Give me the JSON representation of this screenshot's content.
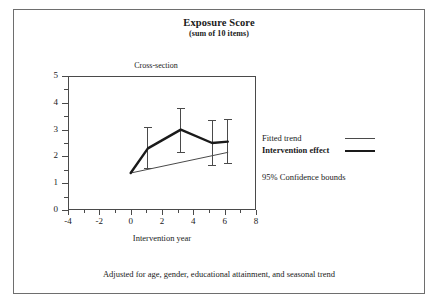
{
  "figure": {
    "title": "Exposure Score",
    "subtitle": "(sum of 10 items)",
    "panel_label": "Cross-section",
    "footnote": "Adjusted for age, gender, educational attainment, and seasonal trend"
  },
  "legend": {
    "fitted_trend": "Fitted trend",
    "intervention_effect": "Intervention effect",
    "confidence": "95% Confidence bounds"
  },
  "chart_data": {
    "type": "line",
    "title": "Exposure Score",
    "subtitle": "(sum of 10 items)",
    "panel_label": "Cross-section",
    "xlabel": "Intervention year",
    "ylabel": "",
    "xlim": [
      -4,
      8
    ],
    "ylim": [
      0,
      5
    ],
    "xticks": [
      -4,
      -2,
      0,
      2,
      4,
      6,
      8
    ],
    "xticklabels": [
      "-4",
      "-2",
      "0",
      "2",
      "4",
      "6",
      "8"
    ],
    "xminorticks": [
      -3,
      -1,
      1,
      3,
      5,
      7
    ],
    "yticks": [
      0,
      1,
      2,
      3,
      4,
      5
    ],
    "yticklabels": [
      "0",
      "1",
      "2",
      "3",
      "4",
      "5"
    ],
    "yminorticks": [
      0.5,
      1.5,
      2.5,
      3.5,
      4.5
    ],
    "grid": false,
    "legend_position": "right",
    "footnote": "Adjusted for age, gender, educational attainment, and seasonal trend",
    "series": [
      {
        "name": "Fitted trend",
        "style": "thin",
        "color": "#4a4a4a",
        "linewidth": 1,
        "x": [
          0.0,
          6.2
        ],
        "values": [
          1.38,
          2.15
        ]
      },
      {
        "name": "Intervention effect",
        "style": "thick",
        "color": "#1a1a1a",
        "linewidth": 2.4,
        "x": [
          0.0,
          1.1,
          3.2,
          5.2,
          6.2
        ],
        "values": [
          1.38,
          2.3,
          3.0,
          2.5,
          2.55
        ]
      }
    ],
    "error_bars": {
      "name": "95% Confidence bounds",
      "color": "#4a4a4a",
      "x": [
        1.1,
        3.2,
        5.2,
        6.2
      ],
      "y": [
        2.3,
        3.0,
        2.5,
        2.55
      ],
      "lower": [
        1.55,
        2.15,
        1.67,
        1.72
      ],
      "upper": [
        3.07,
        3.77,
        3.35,
        3.38
      ]
    }
  }
}
